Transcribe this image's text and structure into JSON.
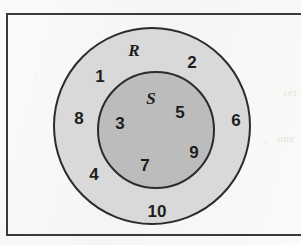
{
  "figure": {
    "kind": "set-diagram",
    "frame": {
      "border_color": "#3a3a3a"
    },
    "background_color": "#f8f8f6",
    "bleed_text": {
      "line1": "set",
      "line2": "one"
    }
  },
  "sets": [
    {
      "id": "R",
      "label": "R",
      "fill_color": "#d9d9d9",
      "stroke_color": "#2b2b2b",
      "label_position": {
        "x": 132,
        "y": 48
      },
      "center": {
        "x": 150,
        "y": 124
      },
      "radius": 98
    },
    {
      "id": "S",
      "label": "S",
      "fill_color": "#bcbcbc",
      "stroke_color": "#2b2b2b",
      "label_position": {
        "x": 149,
        "y": 96
      },
      "center": {
        "x": 154,
        "y": 128
      },
      "radius": 58
    }
  ],
  "elements": [
    {
      "value": "1",
      "region": "R-only",
      "x": 98,
      "y": 74
    },
    {
      "value": "2",
      "region": "R-only",
      "x": 190,
      "y": 60
    },
    {
      "value": "8",
      "region": "R-only",
      "x": 77,
      "y": 116
    },
    {
      "value": "6",
      "region": "R-only",
      "x": 234,
      "y": 118
    },
    {
      "value": "4",
      "region": "R-only",
      "x": 92,
      "y": 172
    },
    {
      "value": "10",
      "region": "R-only",
      "x": 155,
      "y": 209
    },
    {
      "value": "3",
      "region": "S",
      "x": 118,
      "y": 121
    },
    {
      "value": "5",
      "region": "S",
      "x": 178,
      "y": 110
    },
    {
      "value": "9",
      "region": "S",
      "x": 192,
      "y": 150
    },
    {
      "value": "7",
      "region": "S",
      "x": 143,
      "y": 163
    }
  ]
}
